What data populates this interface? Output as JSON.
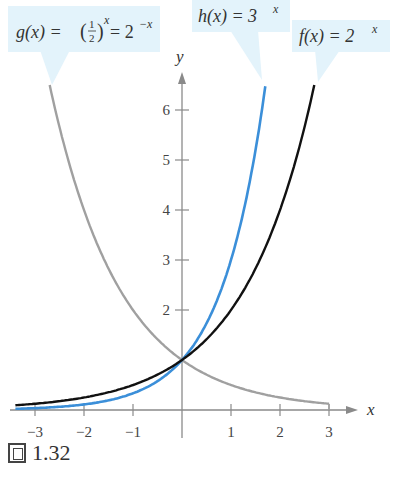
{
  "chart_data": {
    "type": "line",
    "title": "",
    "xlabel": "x",
    "ylabel": "y",
    "xlim": [
      -3.4,
      3.6
    ],
    "ylim": [
      0,
      6.8
    ],
    "x_ticks": [
      -3,
      -2,
      -1,
      1,
      2,
      3
    ],
    "x_tick_labels": [
      "−3",
      "−2",
      "−1",
      "1",
      "2",
      "3"
    ],
    "y_ticks": [
      2,
      3,
      4,
      5,
      6
    ],
    "y_tick_labels": [
      "2",
      "3",
      "4",
      "5",
      "6"
    ],
    "grid": false,
    "series": [
      {
        "name": "g(x) = (1/2)^x = 2^(-x)",
        "color": "#a0a0a0",
        "function": "2^(-x)",
        "x_range": [
          -2.7,
          3
        ],
        "x": [
          -2.7,
          -2,
          -1,
          0,
          1,
          2,
          3
        ],
        "values": [
          6.5,
          4,
          2,
          1,
          0.5,
          0.25,
          0.125
        ]
      },
      {
        "name": "h(x) = 3^x",
        "color": "#3b8fd9",
        "function": "3^x",
        "x_range": [
          -3.4,
          1.7
        ],
        "x": [
          -3,
          -2,
          -1,
          0,
          1,
          1.7
        ],
        "values": [
          0.037,
          0.111,
          0.333,
          1,
          3,
          6.47
        ]
      },
      {
        "name": "f(x) = 2^x",
        "color": "#111111",
        "function": "2^x",
        "x_range": [
          -3.4,
          2.7
        ],
        "x": [
          -3,
          -2,
          -1,
          0,
          1,
          2,
          2.7
        ],
        "values": [
          0.125,
          0.25,
          0.5,
          1,
          2,
          4,
          6.5
        ]
      }
    ],
    "annotations": [
      {
        "text": "g(x) = (1/2)^x = 2^(-x)",
        "target_series": "g"
      },
      {
        "text": "h(x) = 3^x",
        "target_series": "h"
      },
      {
        "text": "f(x) = 2^x",
        "target_series": "f"
      }
    ]
  },
  "labels": {
    "g_prefix": "g(x) = ",
    "g_frac_num": "1",
    "g_frac_den": "2",
    "g_exp": "x",
    "g_equals": " = 2",
    "g_exp2": "−x",
    "h_text": "h(x) = 3",
    "h_exp": "x",
    "f_text": "f(x) = 2",
    "f_exp": "x",
    "axis_x": "x",
    "axis_y": "y"
  },
  "caption": {
    "figure_number": "1.32"
  },
  "colors": {
    "callout_bg": "#e3f3fb",
    "axis": "#8a8a8a",
    "g": "#a0a0a0",
    "h": "#3b8fd9",
    "f": "#111111"
  }
}
